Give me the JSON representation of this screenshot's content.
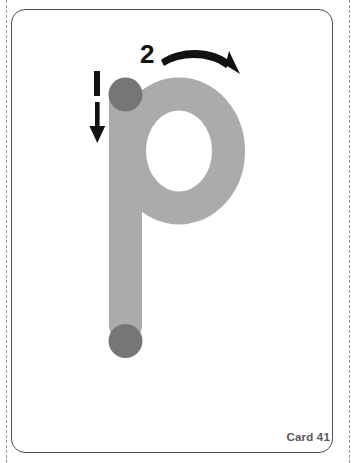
{
  "card": {
    "number_label": "Card 41",
    "border_color": "#4d4d52",
    "background_color": "#ffffff",
    "cut_guide_color": "#9a9a9a"
  },
  "letter": {
    "character": "p",
    "case": "lowercase",
    "stroke_color": "#ababab",
    "start_dot_color": "#767676",
    "marker_color": "#111111",
    "description": "lowercase letter p trace outline"
  },
  "strokes": [
    {
      "order_label": "1",
      "name": "stem-stroke",
      "direction": "down",
      "arrow_icon": "arrow-down-icon"
    },
    {
      "order_label": "2",
      "name": "bowl-stroke",
      "direction": "clockwise-curve-right",
      "arrow_icon": "arrow-curve-right-icon"
    }
  ],
  "dots": [
    {
      "name": "stroke-1-start-dot",
      "position": "stem-top"
    },
    {
      "name": "stroke-1-end-dot",
      "position": "stem-bottom"
    }
  ]
}
